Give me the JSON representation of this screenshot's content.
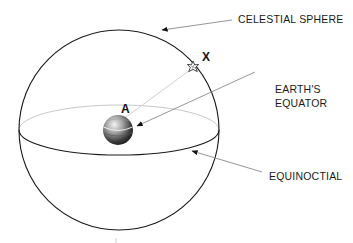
{
  "figure": {
    "type": "celestial-sphere-diagram",
    "labels": {
      "celestial_sphere": "CELESTIAL SPHERE",
      "earths_equator_line1": "EARTH'S",
      "earths_equator_line2": "EQUATOR",
      "equinoctial": "EQUINOCTIAL",
      "point_x": "X",
      "point_a": "A"
    },
    "icons": {
      "star": "star-icon",
      "earth": "earth-globe-icon"
    },
    "colors": {
      "outline": "#1a1a1a",
      "back_equator": "#c8c8c8",
      "leader_line": "#8a8a8a",
      "sight_line": "#d0d0d0",
      "background": "#ffffff"
    }
  }
}
